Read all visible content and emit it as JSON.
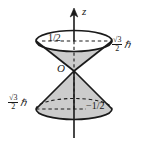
{
  "figure": {
    "type": "physics-vector-model-diagram",
    "background_color": "#ffffff",
    "line_color": "#1a1a1a",
    "cone_fill_color": "#c9c9c9",
    "axis": {
      "label": "z",
      "direction": "up",
      "arrow": true
    },
    "origin": {
      "label": "O"
    },
    "labels": {
      "upper_z_component": "1/2",
      "lower_z_component": "−1/2",
      "magnitude_numerator": "√3",
      "magnitude_denominator": "2",
      "magnitude_unit": "ℏ"
    },
    "annotations": [
      {
        "name": "upper-cone-projection",
        "text": "1/2"
      },
      {
        "name": "upper-cone-magnitude",
        "text": "√3/2 ℏ"
      },
      {
        "name": "lower-cone-projection",
        "text": "−1/2"
      },
      {
        "name": "lower-cone-magnitude",
        "text": "√3/2 ℏ"
      }
    ]
  }
}
